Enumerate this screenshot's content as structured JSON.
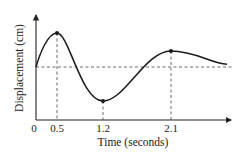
{
  "chart_data": {
    "type": "line",
    "title": "",
    "xlabel": "Time (seconds)",
    "ylabel": "Displacement (cm)",
    "x_tick_labels": [
      "0",
      "0.5",
      "1.2",
      "2.1"
    ],
    "x_ticks": [
      0,
      0.5,
      1.2,
      2.1
    ],
    "equilibrium_line": "dashed horizontal at starting displacement",
    "series": [
      {
        "name": "displacement",
        "style": "smooth damped oscillation",
        "key_points": [
          {
            "t": 0,
            "y": 0,
            "label": "start"
          },
          {
            "t": 0.5,
            "y": 1.0,
            "label": "maximum",
            "marked": true
          },
          {
            "t": 1.2,
            "y": -1.0,
            "label": "minimum",
            "marked": true
          },
          {
            "t": 2.1,
            "y": 0.47,
            "label": "local maximum",
            "marked": true
          },
          {
            "t": 2.9,
            "y": 0.08,
            "label": "end"
          }
        ]
      }
    ],
    "y_ticks": [],
    "grid": false,
    "legend": "none"
  }
}
